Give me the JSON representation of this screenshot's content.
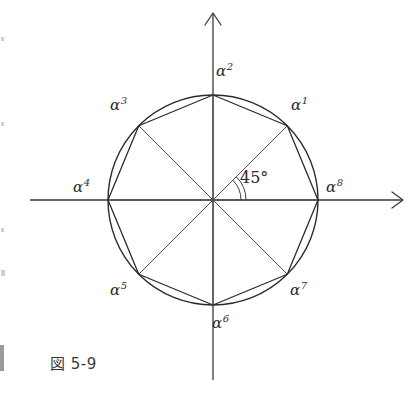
{
  "figure": {
    "caption": "図 5-9",
    "angle_label": "45°",
    "axes": {
      "x_axis_name": "x-axis",
      "y_axis_name": "y-axis"
    },
    "geometry": {
      "center_x": 213,
      "center_y": 200,
      "radius": 105,
      "sides": 8,
      "start_angle_deg": 45
    },
    "vertices": [
      {
        "base": "α",
        "exponent": "1",
        "angle_deg": 45,
        "label_x": 291,
        "label_y": 98
      },
      {
        "base": "α",
        "exponent": "2",
        "angle_deg": 90,
        "label_x": 216,
        "label_y": 64
      },
      {
        "base": "α",
        "exponent": "3",
        "angle_deg": 135,
        "label_x": 110,
        "label_y": 98
      },
      {
        "base": "α",
        "exponent": "4",
        "angle_deg": 180,
        "label_x": 73,
        "label_y": 180
      },
      {
        "base": "α",
        "exponent": "5",
        "angle_deg": 225,
        "label_x": 110,
        "label_y": 283
      },
      {
        "base": "α",
        "exponent": "6",
        "angle_deg": 270,
        "label_x": 212,
        "label_y": 316
      },
      {
        "base": "α",
        "exponent": "7",
        "angle_deg": 315,
        "label_x": 290,
        "label_y": 283
      },
      {
        "base": "α",
        "exponent": "8",
        "angle_deg": 0,
        "label_x": 326,
        "label_y": 180
      }
    ],
    "colors": {
      "ink": "#2b2b2b",
      "line": "#3a3a3a",
      "background": "#ffffff"
    }
  }
}
